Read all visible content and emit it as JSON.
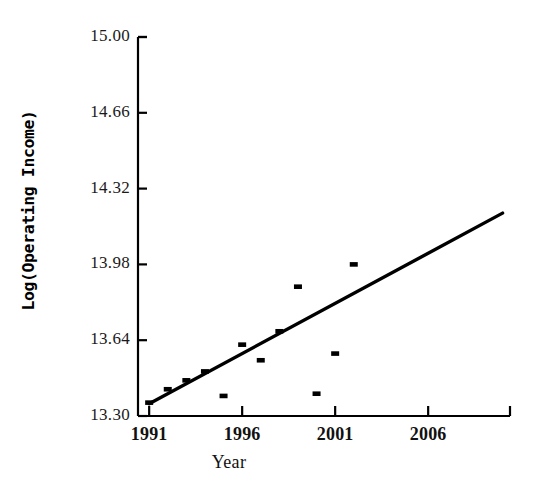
{
  "chart_data": {
    "type": "scatter",
    "title": "",
    "xlabel": "Year",
    "ylabel": "Log(Operating Income)",
    "xlim": [
      1990.4,
      2010.4
    ],
    "ylim": [
      13.3,
      15.0
    ],
    "grid": false,
    "legend": false,
    "xticks": [
      1991,
      1996,
      2001,
      2006
    ],
    "xtick_labels": [
      "1991",
      "1996",
      "2001",
      "2006"
    ],
    "yticks": [
      13.3,
      13.64,
      13.98,
      14.32,
      14.66,
      15.0
    ],
    "ytick_labels": [
      "13.30",
      "13.64",
      "13.98",
      "14.32",
      "14.66",
      "15.00"
    ],
    "marker_color": "#000000",
    "line_color": "#000000",
    "axis_color": "#000000",
    "series": [
      {
        "name": "Observed",
        "type": "scatter",
        "x": [
          1991,
          1992,
          1993,
          1994,
          1995,
          1996,
          1997,
          1998,
          1999,
          2000,
          2001,
          2002
        ],
        "y": [
          13.36,
          13.42,
          13.46,
          13.5,
          13.39,
          13.62,
          13.55,
          13.68,
          13.88,
          13.4,
          13.58,
          13.98
        ]
      },
      {
        "name": "Fitted trend",
        "type": "line",
        "x": [
          1991,
          2010
        ],
        "y": [
          13.355,
          14.21
        ]
      }
    ]
  },
  "axes": {
    "x_axis_name": "year-axis",
    "y_axis_name": "log-operating-income-axis"
  }
}
